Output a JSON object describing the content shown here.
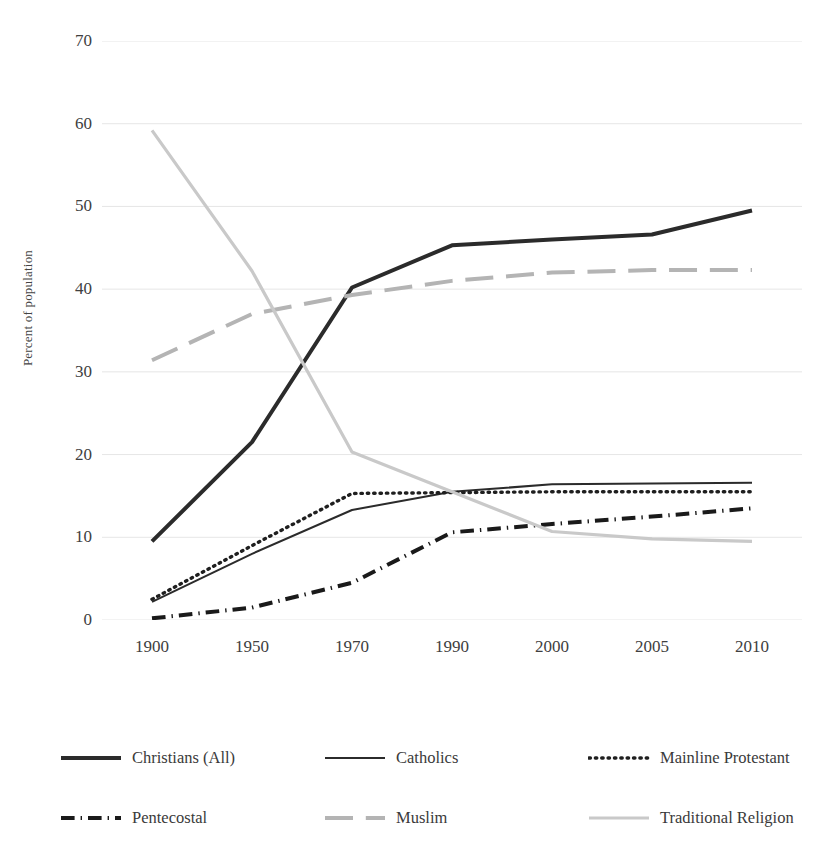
{
  "chart_data": {
    "type": "line",
    "title": "",
    "xlabel": "",
    "ylabel": "Percent of population",
    "categories": [
      "1900",
      "1950",
      "1970",
      "1990",
      "2000",
      "2005",
      "2010"
    ],
    "ylim": [
      0,
      70
    ],
    "yticks": [
      0,
      10,
      20,
      30,
      40,
      50,
      60,
      70
    ],
    "grid": true,
    "legend_position": "bottom",
    "series": [
      {
        "name": "Christians (All)",
        "values": [
          9.5,
          21.5,
          40.2,
          45.3,
          46.0,
          46.6,
          49.5
        ],
        "color": "#2b2b2b",
        "style": "solid",
        "width": 4
      },
      {
        "name": "Catholics",
        "values": [
          2.2,
          8.0,
          13.3,
          15.5,
          16.4,
          16.5,
          16.6
        ],
        "color": "#2b2b2b",
        "style": "solid",
        "width": 2
      },
      {
        "name": "Mainline Protestant",
        "values": [
          2.5,
          9.0,
          15.3,
          15.4,
          15.5,
          15.5,
          15.5
        ],
        "color": "#1f1f1f",
        "style": "dotted",
        "width": 3.4
      },
      {
        "name": "Pentecostal",
        "values": [
          0.2,
          1.5,
          4.5,
          10.6,
          11.6,
          12.5,
          13.5
        ],
        "color": "#1a1a1a",
        "style": "dash-dot",
        "width": 4
      },
      {
        "name": "Muslim",
        "values": [
          31.4,
          37.0,
          39.3,
          41.0,
          42.0,
          42.3,
          42.3
        ],
        "color": "#b4b4b4",
        "style": "dashed",
        "width": 4
      },
      {
        "name": "Traditional Religion",
        "values": [
          59.2,
          42.2,
          20.3,
          15.5,
          10.7,
          9.8,
          9.5
        ],
        "color": "#c9c9c9",
        "style": "solid",
        "width": 3.2
      }
    ]
  },
  "axis": {
    "y_title": "Percent of population",
    "y_labels": [
      "70",
      "60",
      "50",
      "40",
      "30",
      "20",
      "10",
      "0"
    ],
    "x_labels": [
      "1900",
      "1950",
      "1970",
      "1990",
      "2000",
      "2005",
      "2010"
    ]
  },
  "legend": {
    "items": [
      {
        "label": "Christians (All)",
        "swatch": "solid-thick-dark"
      },
      {
        "label": "Catholics",
        "swatch": "solid-medium-dark"
      },
      {
        "label": "Mainline Protestant",
        "swatch": "dotted-dark"
      },
      {
        "label": "Pentecostal",
        "swatch": "dash-dot-dark"
      },
      {
        "label": "Muslim",
        "swatch": "dashed-gray"
      },
      {
        "label": "Traditional Religion",
        "swatch": "solid-light-gray"
      }
    ]
  },
  "colors": {
    "dark": "#2b2b2b",
    "mid_gray": "#b4b4b4",
    "light_gray": "#c9c9c9",
    "gridline": "#e6e6e6",
    "text": "#3a3a3a",
    "background": "#ffffff"
  }
}
